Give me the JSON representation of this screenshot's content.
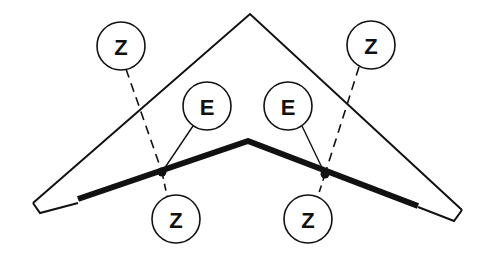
{
  "diagram": {
    "title": "",
    "colors": {
      "stroke": "#111111",
      "background": "#ffffff"
    },
    "wing_outline": {
      "points": [
        [
          250,
          14
        ],
        [
          462,
          210
        ],
        [
          454,
          221
        ],
        [
          418,
          206
        ],
        [
          248,
          141
        ],
        [
          78,
          197
        ],
        [
          40,
          213
        ],
        [
          33,
          203
        ]
      ]
    },
    "spar_line": {
      "points": [
        [
          78,
          197
        ],
        [
          248,
          140
        ],
        [
          418,
          205
        ]
      ],
      "width": 6
    },
    "junctions": [
      {
        "id": "left-junction",
        "x": 162,
        "y": 172
      },
      {
        "id": "right-junction",
        "x": 325,
        "y": 174
      }
    ],
    "labels": [
      {
        "id": "z-top-left",
        "text": "Z",
        "cx": 121,
        "cy": 46,
        "r": 24,
        "leader": "dashed",
        "target": [
          162,
          172
        ]
      },
      {
        "id": "z-top-right",
        "text": "Z",
        "cx": 371,
        "cy": 45,
        "r": 24,
        "leader": "dashed",
        "target": [
          325,
          174
        ]
      },
      {
        "id": "e-left",
        "text": "E",
        "cx": 207,
        "cy": 106,
        "r": 24,
        "leader": "solid",
        "target": [
          162,
          172
        ]
      },
      {
        "id": "e-right",
        "text": "E",
        "cx": 288,
        "cy": 106,
        "r": 24,
        "leader": "solid",
        "target": [
          325,
          174
        ]
      },
      {
        "id": "z-bottom-left",
        "text": "Z",
        "cx": 176,
        "cy": 219,
        "r": 24,
        "leader": "solid",
        "target": [
          162,
          172
        ]
      },
      {
        "id": "z-bottom-right",
        "text": "Z",
        "cx": 308,
        "cy": 219,
        "r": 24,
        "leader": "solid",
        "target": [
          325,
          174
        ]
      }
    ]
  }
}
